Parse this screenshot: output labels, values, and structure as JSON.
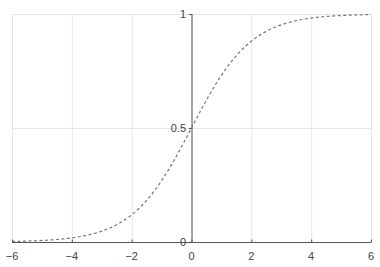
{
  "chart_data": {
    "type": "line",
    "title": "",
    "xlabel": "",
    "ylabel": "",
    "xlim": [
      -6,
      6
    ],
    "ylim": [
      0,
      1
    ],
    "grid": true,
    "legend": null,
    "x_ticks": [
      -6,
      -4,
      -2,
      0,
      2,
      4,
      6
    ],
    "x_tick_labels": [
      "−6",
      "−4",
      "−2",
      "0",
      "2",
      "4",
      "6"
    ],
    "y_ticks": [
      0,
      0.5,
      1
    ],
    "y_tick_labels": [
      "0",
      "0.5",
      "1"
    ],
    "series": [
      {
        "name": "sigmoid",
        "style": "dashed",
        "color": "#777777",
        "x": [
          -6,
          -5,
          -4,
          -3,
          -2,
          -1,
          0,
          1,
          2,
          3,
          4,
          5,
          6
        ],
        "y": [
          0.0025,
          0.0067,
          0.018,
          0.047,
          0.119,
          0.269,
          0.5,
          0.731,
          0.881,
          0.953,
          0.982,
          0.993,
          0.9975
        ]
      }
    ]
  },
  "colors": {
    "grid": "#e6e6e6",
    "axis": "#555555",
    "curve": "#777777"
  }
}
